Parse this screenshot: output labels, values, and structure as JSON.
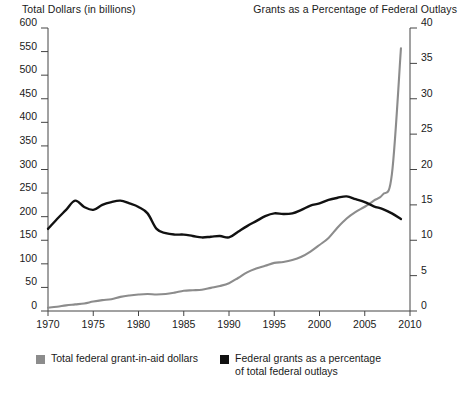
{
  "axis_titles": {
    "left": "Total Dollars (in billions)",
    "right": "Grants as a Percentage of Federal Outlays"
  },
  "legend": {
    "items": [
      {
        "label": "Total federal grant-in-aid dollars",
        "color": "#8c8c8c",
        "swatch_name": "legend-swatch-dollars"
      },
      {
        "label": "Federal grants as a percentage of total federal outlays",
        "color": "#111111",
        "swatch_name": "legend-swatch-percentage"
      }
    ]
  },
  "chart_data": {
    "type": "line",
    "title": "",
    "xlabel": "",
    "grid": false,
    "legend_position": "bottom-left",
    "x": [
      1970,
      1971,
      1972,
      1973,
      1974,
      1975,
      1976,
      1977,
      1978,
      1979,
      1980,
      1981,
      1982,
      1983,
      1984,
      1985,
      1986,
      1987,
      1988,
      1989,
      1990,
      1991,
      1992,
      1993,
      1994,
      1995,
      1996,
      1997,
      1998,
      1999,
      2000,
      2001,
      2002,
      2003,
      2004,
      2005,
      2006,
      2007,
      2008,
      2009
    ],
    "xlim": [
      1970,
      2010
    ],
    "xticks": [
      1970,
      1975,
      1980,
      1985,
      1990,
      1995,
      2000,
      2005,
      2010
    ],
    "xtick_labels": [
      "1970",
      "1975",
      "1980",
      "1985",
      "1990",
      "1995",
      "2000",
      "2005",
      "2010"
    ],
    "axes": [
      {
        "id": "left",
        "name": "Total Dollars (in billions)",
        "ylim": [
          0,
          600
        ],
        "yticks": [
          0,
          50,
          100,
          150,
          200,
          250,
          300,
          350,
          400,
          450,
          500,
          550,
          600
        ],
        "ytick_labels": [
          "0",
          "50",
          "100",
          "150",
          "200",
          "250",
          "300",
          "350",
          "400",
          "450",
          "500",
          "550",
          "600"
        ]
      },
      {
        "id": "right",
        "name": "Grants as a Percentage of Federal Outlays",
        "ylim": [
          0,
          40
        ],
        "yticks": [
          0,
          5,
          10,
          15,
          20,
          25,
          30,
          35,
          40
        ],
        "ytick_labels": [
          "0",
          "5",
          "10",
          "15",
          "20",
          "25",
          "30",
          "35",
          "40"
        ]
      }
    ],
    "series": [
      {
        "name": "Total federal grant-in-aid dollars",
        "axis": "left",
        "color": "#8c8c8c",
        "unit": "billions of dollars",
        "values": [
          7,
          9,
          12,
          14,
          16,
          20,
          23,
          25,
          30,
          33,
          35,
          36,
          35,
          36,
          39,
          43,
          44,
          45,
          49,
          53,
          59,
          70,
          82,
          90,
          96,
          102,
          104,
          108,
          115,
          126,
          140,
          155,
          177,
          196,
          210,
          221,
          234,
          247,
          290,
          557
        ]
      },
      {
        "name": "Federal grants as a percentage of total federal outlays",
        "axis": "right",
        "color": "#111111",
        "unit": "percent",
        "values": [
          11.6,
          13.0,
          14.3,
          15.6,
          14.7,
          14.3,
          15.0,
          15.4,
          15.6,
          15.2,
          14.7,
          13.8,
          11.6,
          11.0,
          10.8,
          10.8,
          10.6,
          10.4,
          10.5,
          10.6,
          10.4,
          11.2,
          12.0,
          12.7,
          13.4,
          13.8,
          13.7,
          13.8,
          14.3,
          14.9,
          15.2,
          15.7,
          16.0,
          16.2,
          15.8,
          15.4,
          14.8,
          14.4,
          13.8,
          13.0
        ]
      }
    ]
  }
}
